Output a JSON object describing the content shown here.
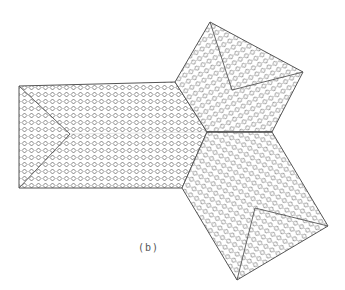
{
  "figure": {
    "label": "(b)",
    "colors": {
      "line": "#555555",
      "background": "#ffffff"
    },
    "pattern": "diamond-tiles"
  }
}
